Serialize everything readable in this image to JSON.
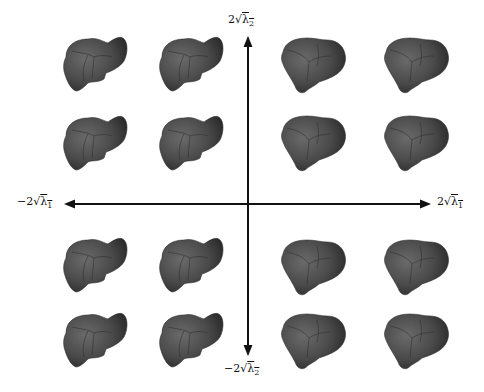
{
  "figure": {
    "axes": {
      "horizontal": {
        "left_label": {
          "prefix": "−2",
          "radicand": "λ",
          "sub": "1"
        },
        "right_label": {
          "prefix": "2",
          "radicand": "λ",
          "sub": "1"
        }
      },
      "vertical": {
        "top_label": {
          "prefix": "2",
          "radicand": "λ",
          "sub": "2"
        },
        "bottom_label": {
          "prefix": "−2",
          "radicand": "λ",
          "sub": "2"
        }
      }
    },
    "grid": {
      "rows": 4,
      "cols": 4,
      "item": "liver-mesh",
      "color": "#4a4a4a"
    }
  }
}
